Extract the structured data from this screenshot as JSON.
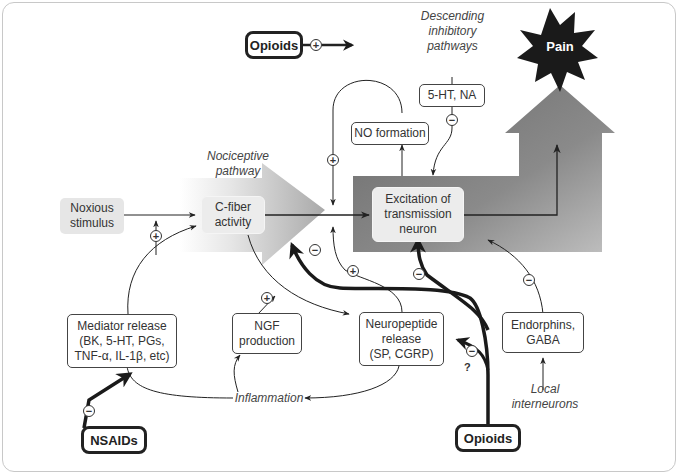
{
  "diagram": {
    "nodes": {
      "pain": "Pain",
      "opioids_top": "Opioids",
      "descending": "Descending inhibitory pathways",
      "descending_l1": "Descending",
      "descending_l2": "inhibitory",
      "descending_l3": "pathways",
      "ht_na": "5-HT, NA",
      "no_formation": "NO formation",
      "nociceptive_l1": "Nociceptive",
      "nociceptive_l2": "pathway",
      "noxious_l1": "Noxious",
      "noxious_l2": "stimulus",
      "cfiber_l1": "C-fiber",
      "cfiber_l2": "activity",
      "excitation_l1": "Excitation of",
      "excitation_l2": "transmission",
      "excitation_l3": "neuron",
      "mediator_l1": "Mediator release",
      "mediator_l2": "(BK, 5-HT, PGs,",
      "mediator_l3": "TNF-α, IL-1β, etc)",
      "ngf_l1": "NGF",
      "ngf_l2": "production",
      "neuropeptide_l1": "Neuropeptide",
      "neuropeptide_l2": "release",
      "neuropeptide_l3": "(SP, CGRP)",
      "endorphins_l1": "Endorphins,",
      "endorphins_l2": "GABA",
      "local_l1": "Local",
      "local_l2": "interneurons",
      "inflammation": "Inflammation",
      "nsaids": "NSAIDs",
      "opioids_bottom": "Opioids"
    },
    "signs": {
      "plus": "+",
      "minus": "−",
      "question": "?"
    },
    "colors": {
      "outline": "#333333",
      "thick_arrow": "#1a1a1a",
      "nociceptive_arrow_dark": "#a8a8a8",
      "transmission_dark": "#6e6e6e",
      "transmission_light": "#b8b8b8",
      "pain_burst": "#1a1a1a"
    }
  }
}
